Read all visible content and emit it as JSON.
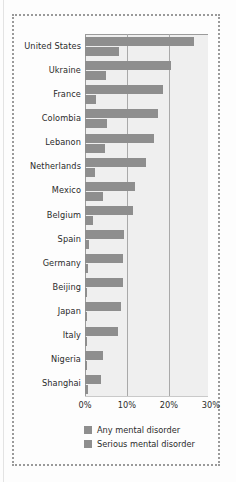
{
  "chart_data": {
    "type": "bar",
    "orientation": "horizontal",
    "title": "",
    "subtitle": "",
    "xlabel": "",
    "ylabel": "",
    "xlim": [
      0,
      30
    ],
    "xticks": [
      0,
      10,
      20,
      30
    ],
    "xtick_labels": [
      "0%",
      "10%",
      "20%",
      "30%"
    ],
    "grid": "vertical",
    "legend_position": "bottom",
    "categories": [
      "United States",
      "Ukraine",
      "France",
      "Colombia",
      "Lebanon",
      "Netherlands",
      "Mexico",
      "Belgium",
      "Spain",
      "Germany",
      "Beijing",
      "Japan",
      "Italy",
      "Nigeria",
      "Shanghai"
    ],
    "series": [
      {
        "name": "Any mental disorder",
        "color": "#8e8e8e",
        "values": [
          26.0,
          20.5,
          18.5,
          17.5,
          16.5,
          14.5,
          12.0,
          11.5,
          9.2,
          9.1,
          9.1,
          8.5,
          7.8,
          4.3,
          3.8
        ]
      },
      {
        "name": "Serious mental disorder",
        "color": "#8e8e8e",
        "values": [
          8.0,
          5.0,
          2.7,
          5.2,
          4.8,
          2.4,
          4.3,
          2.0,
          1.0,
          0.6,
          0.4,
          0.5,
          0.4,
          0.4,
          0.6
        ]
      }
    ]
  },
  "legend": {
    "items": [
      {
        "label": "Any mental disorder"
      },
      {
        "label": "Serious mental disorder"
      }
    ]
  },
  "colors": {
    "bar": "#8e8e8e",
    "plot_background": "#efefef",
    "gridline": "#a9a9a9",
    "axis": "#9b9b9b",
    "text": "#2b2b2b",
    "frame_border": "#9a9a9a",
    "page_background": "#fdfdfd"
  }
}
